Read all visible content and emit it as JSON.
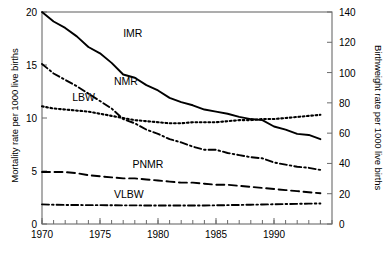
{
  "chart_data": {
    "type": "line",
    "title": "",
    "xlabel": "",
    "ylabel": "Mortality rate per 1000 live births",
    "y2label": "Birthweight rate per 1000 live births",
    "xlim": [
      1970,
      1995
    ],
    "ylim": [
      0,
      20
    ],
    "y2lim": [
      0,
      140
    ],
    "xticks": [
      1970,
      1975,
      1980,
      1985,
      1990
    ],
    "xtick_labels": [
      "1970",
      "1975",
      "1980",
      "1985",
      "1990"
    ],
    "xtick_minor_step": 1,
    "yticks": [
      0,
      5,
      10,
      15,
      20
    ],
    "ytick_labels": [
      "0",
      "5",
      "10",
      "15",
      "20"
    ],
    "y2ticks": [
      0,
      20,
      40,
      60,
      80,
      100,
      120,
      140
    ],
    "y2tick_labels": [
      "0",
      "20",
      "40",
      "60",
      "80",
      "100",
      "120",
      "140"
    ],
    "grid": false,
    "legend_position": "inline-annotations",
    "x": [
      1970,
      1971,
      1972,
      1973,
      1974,
      1975,
      1976,
      1977,
      1978,
      1979,
      1980,
      1981,
      1982,
      1983,
      1984,
      1985,
      1986,
      1987,
      1988,
      1989,
      1990,
      1991,
      1992,
      1993,
      1994
    ],
    "series": [
      {
        "name": "IMR",
        "label": "IMR",
        "axis": "left",
        "linestyle": "solid",
        "color": "#000000",
        "values": [
          20.0,
          19.1,
          18.5,
          17.7,
          16.7,
          16.1,
          15.2,
          14.1,
          13.8,
          13.1,
          12.6,
          11.9,
          11.5,
          11.2,
          10.8,
          10.6,
          10.4,
          10.1,
          9.9,
          9.8,
          9.2,
          8.9,
          8.5,
          8.4,
          8.0
        ],
        "value_at_start": 20.0,
        "value_at_end": 8.0
      },
      {
        "name": "NMR",
        "label": "NMR",
        "axis": "left",
        "linestyle": "dashdot",
        "color": "#000000",
        "values": [
          15.1,
          14.2,
          13.6,
          13.0,
          12.3,
          11.6,
          10.9,
          9.9,
          9.5,
          8.9,
          8.5,
          8.0,
          7.7,
          7.3,
          7.0,
          7.0,
          6.7,
          6.5,
          6.3,
          6.2,
          5.8,
          5.6,
          5.4,
          5.3,
          5.1
        ],
        "value_at_start": 15.1,
        "value_at_end": 5.1
      },
      {
        "name": "LBW",
        "label": "LBW",
        "axis": "right",
        "linestyle": "dotted",
        "color": "#000000",
        "values_left_scale": [
          11.1,
          10.9,
          10.8,
          10.7,
          10.6,
          10.4,
          10.2,
          10.0,
          9.8,
          9.7,
          9.6,
          9.5,
          9.5,
          9.6,
          9.6,
          9.6,
          9.7,
          9.8,
          9.8,
          9.9,
          9.9,
          10.0,
          10.1,
          10.2,
          10.3
        ],
        "values": [
          77.7,
          76.3,
          75.6,
          74.9,
          74.2,
          72.8,
          71.4,
          70.0,
          68.6,
          67.9,
          67.2,
          66.5,
          66.5,
          67.2,
          67.2,
          67.2,
          67.9,
          68.6,
          68.6,
          69.3,
          69.3,
          70.0,
          70.7,
          71.4,
          72.1
        ],
        "value_at_start": 77.7,
        "value_at_end": 72.1
      },
      {
        "name": "PNMR",
        "label": "PNMR",
        "axis": "left",
        "linestyle": "dashed",
        "color": "#000000",
        "values": [
          4.9,
          4.9,
          4.9,
          4.8,
          4.6,
          4.5,
          4.4,
          4.3,
          4.3,
          4.2,
          4.1,
          4.0,
          3.9,
          3.9,
          3.8,
          3.7,
          3.7,
          3.6,
          3.5,
          3.4,
          3.3,
          3.2,
          3.1,
          3.0,
          2.9
        ],
        "value_at_start": 4.9,
        "value_at_end": 2.9
      },
      {
        "name": "VLBW",
        "label": "VLBW",
        "axis": "right",
        "linestyle": "dashdot",
        "color": "#000000",
        "values_left_scale": [
          1.85,
          1.82,
          1.8,
          1.79,
          1.78,
          1.78,
          1.77,
          1.76,
          1.76,
          1.75,
          1.74,
          1.74,
          1.74,
          1.74,
          1.75,
          1.76,
          1.78,
          1.8,
          1.82,
          1.84,
          1.86,
          1.88,
          1.9,
          1.92,
          1.94
        ],
        "values": [
          12.95,
          12.74,
          12.6,
          12.53,
          12.46,
          12.46,
          12.39,
          12.32,
          12.32,
          12.25,
          12.18,
          12.18,
          12.18,
          12.18,
          12.25,
          12.32,
          12.46,
          12.6,
          12.74,
          12.88,
          13.02,
          13.16,
          13.3,
          13.44,
          13.58
        ],
        "value_at_start": 12.95,
        "value_at_end": 13.58
      }
    ],
    "annotations": [
      {
        "text": "IMR",
        "x": 1977.0,
        "y": 17.6
      },
      {
        "text": "NMR",
        "x": 1976.2,
        "y": 13.1
      },
      {
        "text": "LBW",
        "x": 1972.6,
        "y": 11.6
      },
      {
        "text": "PNMR",
        "x": 1977.8,
        "y": 5.3
      },
      {
        "text": "VLBW",
        "x": 1976.2,
        "y": 2.5
      }
    ]
  }
}
